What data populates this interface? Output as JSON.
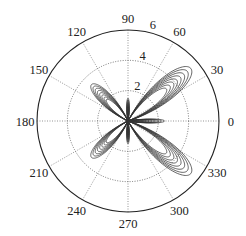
{
  "chart_data": {
    "type": "polar-line",
    "title": "",
    "center": {
      "x": 128,
      "y": 121
    },
    "radius_px": 91,
    "rlim": [
      0,
      6
    ],
    "radial_ticks": [
      2,
      4,
      6
    ],
    "radial_tick_labels": [
      "2",
      "4",
      "6"
    ],
    "radial_label_angle_deg": 80,
    "angular_ticks": [
      0,
      30,
      60,
      90,
      120,
      150,
      180,
      210,
      240,
      270,
      300,
      330
    ],
    "angular_tick_labels": [
      "0",
      "30",
      "60",
      "90",
      "120",
      "150",
      "180",
      "210",
      "240",
      "270",
      "300",
      "330"
    ],
    "grid": true,
    "grid_style": "dotted",
    "line_color": "#333333",
    "lobes": [
      {
        "angle_deg": 40,
        "peak_r": [
          5.4,
          5.1,
          4.8,
          4.5,
          4.2,
          3.9,
          3.6,
          3.3
        ],
        "half_width_deg": 24
      },
      {
        "angle_deg": 320,
        "peak_r": [
          5.4,
          5.1,
          4.8,
          4.5,
          4.2,
          3.9,
          3.6,
          3.3
        ],
        "half_width_deg": 24
      },
      {
        "angle_deg": 135,
        "peak_r": [
          3.4,
          3.2,
          3.0,
          2.8,
          2.6,
          2.4,
          2.2,
          2.0
        ],
        "half_width_deg": 22
      },
      {
        "angle_deg": 225,
        "peak_r": [
          3.4,
          3.2,
          3.0,
          2.8,
          2.6,
          2.4,
          2.2,
          2.0
        ],
        "half_width_deg": 22
      },
      {
        "angle_deg": 90,
        "peak_r": [
          1.5,
          1.4,
          1.3,
          1.2,
          1.1,
          1.0,
          0.9,
          0.8
        ],
        "half_width_deg": 10
      },
      {
        "angle_deg": 270,
        "peak_r": [
          1.5,
          1.4,
          1.3,
          1.2,
          1.1,
          1.0,
          0.9,
          0.8
        ],
        "half_width_deg": 10
      },
      {
        "angle_deg": 0,
        "peak_r": [
          2.4,
          2.2,
          2.0,
          1.8,
          1.6,
          1.4,
          1.2,
          1.0
        ],
        "half_width_deg": 10
      }
    ]
  }
}
